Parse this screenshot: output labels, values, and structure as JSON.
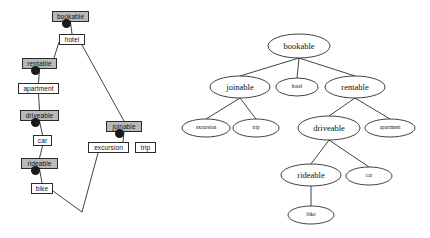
{
  "figure": {
    "title": "",
    "left_diagram": {
      "type": "concept-lattice",
      "name": "boxed lattice diagram",
      "attribute_nodes": [
        {
          "id": "bookable",
          "label": "bookable",
          "x": 52,
          "y": 11,
          "w": 37,
          "style": "shaded"
        },
        {
          "id": "rentable",
          "label": "rentable",
          "x": 22,
          "y": 58,
          "w": 35,
          "style": "shaded"
        },
        {
          "id": "driveable",
          "label": "driveable",
          "x": 20,
          "y": 110,
          "w": 39,
          "style": "shaded"
        },
        {
          "id": "rideable",
          "label": "rideable",
          "x": 21,
          "y": 158,
          "w": 37,
          "style": "shaded"
        },
        {
          "id": "joinable",
          "label": "joinable",
          "x": 106,
          "y": 121,
          "w": 36,
          "style": "shaded"
        }
      ],
      "object_nodes": [
        {
          "id": "hotel",
          "label": "hotel",
          "x": 59,
          "y": 34,
          "w": 26,
          "style": "plain"
        },
        {
          "id": "apartment",
          "label": "apartment",
          "x": 18,
          "y": 83,
          "w": 41,
          "style": "plain"
        },
        {
          "id": "car",
          "label": "car",
          "x": 33,
          "y": 135,
          "w": 19,
          "style": "plain"
        },
        {
          "id": "bike",
          "label": "bike",
          "x": 31,
          "y": 183,
          "w": 22,
          "style": "plain"
        },
        {
          "id": "excursion",
          "label": "excursion",
          "x": 88,
          "y": 142,
          "w": 41,
          "style": "plain"
        },
        {
          "id": "trip",
          "label": "trip",
          "x": 135,
          "y": 142,
          "w": 21,
          "style": "plain"
        }
      ],
      "concept_dots": [
        {
          "id": "dot-bookable",
          "x": 66,
          "y": 23
        },
        {
          "id": "dot-rentable",
          "x": 35,
          "y": 70
        },
        {
          "id": "dot-driveable",
          "x": 35,
          "y": 122
        },
        {
          "id": "dot-rideable",
          "x": 35,
          "y": 170
        },
        {
          "id": "dot-joinable",
          "x": 119,
          "y": 133
        }
      ],
      "bottom_vertex": {
        "x": 82,
        "y": 212
      },
      "edges": [
        {
          "from": "hotel",
          "to": "rentable"
        },
        {
          "from": "hotel",
          "to": "joinable"
        },
        {
          "from": "apartment",
          "to": "driveable"
        },
        {
          "from": "car",
          "to": "rideable"
        },
        {
          "from": "bike",
          "to": "bottom"
        },
        {
          "from": "excursion",
          "to": "bottom"
        }
      ]
    },
    "right_diagram": {
      "type": "taxonomy-tree",
      "name": "ellipse tree diagram",
      "nodes": [
        {
          "id": "bookable",
          "label": "bookable",
          "cx": 299,
          "cy": 46,
          "rx": 31,
          "ry": 12,
          "size": "big"
        },
        {
          "id": "joinable",
          "label": "joinable",
          "cx": 240,
          "cy": 87,
          "rx": 30,
          "ry": 11,
          "size": "big"
        },
        {
          "id": "hotel",
          "label": "hotel",
          "cx": 297,
          "cy": 87,
          "rx": 21,
          "ry": 9,
          "size": "small"
        },
        {
          "id": "rentable",
          "label": "rentable",
          "cx": 355,
          "cy": 87,
          "rx": 30,
          "ry": 11,
          "size": "big"
        },
        {
          "id": "excursion",
          "label": "excursion",
          "cx": 206,
          "cy": 128,
          "rx": 24,
          "ry": 9,
          "size": "small"
        },
        {
          "id": "trip",
          "label": "trip",
          "cx": 256,
          "cy": 128,
          "rx": 23,
          "ry": 9,
          "size": "small"
        },
        {
          "id": "driveable",
          "label": "driveable",
          "cx": 329,
          "cy": 128,
          "rx": 31,
          "ry": 12,
          "size": "big"
        },
        {
          "id": "apartment",
          "label": "apartment",
          "cx": 390,
          "cy": 128,
          "rx": 25,
          "ry": 9,
          "size": "small"
        },
        {
          "id": "rideable",
          "label": "rideable",
          "cx": 311,
          "cy": 175,
          "rx": 30,
          "ry": 11,
          "size": "big"
        },
        {
          "id": "car",
          "label": "car",
          "cx": 369,
          "cy": 176,
          "rx": 23,
          "ry": 9,
          "size": "small"
        },
        {
          "id": "bike",
          "label": "bike",
          "cx": 311,
          "cy": 215,
          "rx": 23,
          "ry": 9,
          "size": "small"
        }
      ],
      "edges": [
        {
          "from": "bookable",
          "to": "joinable"
        },
        {
          "from": "bookable",
          "to": "hotel"
        },
        {
          "from": "bookable",
          "to": "rentable"
        },
        {
          "from": "joinable",
          "to": "excursion"
        },
        {
          "from": "joinable",
          "to": "trip"
        },
        {
          "from": "rentable",
          "to": "driveable"
        },
        {
          "from": "rentable",
          "to": "apartment"
        },
        {
          "from": "driveable",
          "to": "rideable"
        },
        {
          "from": "driveable",
          "to": "car"
        },
        {
          "from": "rideable",
          "to": "bike"
        }
      ]
    },
    "colors": {
      "shaded_fill": "#b9b9b9",
      "plain_fill": "#ffffff",
      "stroke": "#2b2b2b",
      "dot": "#1a1a1a",
      "background": "#ffffff"
    }
  }
}
